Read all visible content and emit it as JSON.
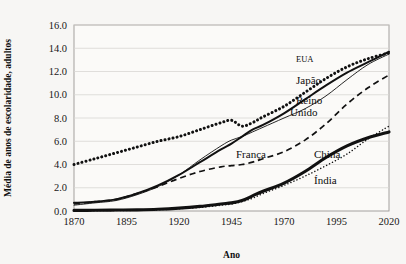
{
  "axes": {
    "y_title": "Média de anos de escolaridade, adultos",
    "x_title": "Ano",
    "y_ticks": [
      "0.0",
      "2.0",
      "4.0",
      "6.0",
      "8.0",
      "10.0",
      "12.0",
      "14.0",
      "16.0"
    ],
    "x_ticks": [
      "1870",
      "1895",
      "1920",
      "1945",
      "1970",
      "1995",
      "2020"
    ]
  },
  "labels": {
    "eua": "EUA",
    "japao": "Japão",
    "reino": "Reino",
    "unido": "Unido",
    "franca": "França",
    "china": "China",
    "india": "Índia"
  },
  "colors": {
    "ink": "#111111",
    "background": "#f7f6f4",
    "plot_background": "#fbfaf8",
    "grid": "#d9d7d3"
  },
  "chart_data": {
    "type": "line",
    "title": "",
    "xlabel": "Ano",
    "ylabel": "Média de anos de escolaridade, adultos",
    "xlim": [
      1870,
      2020
    ],
    "ylim": [
      0.0,
      16.0
    ],
    "grid": true,
    "legend": "inline-annotations",
    "x": [
      1870,
      1880,
      1890,
      1900,
      1910,
      1920,
      1930,
      1940,
      1945,
      1950,
      1955,
      1960,
      1970,
      1980,
      1990,
      2000,
      2010,
      2020
    ],
    "series": [
      {
        "name": "EUA",
        "style": "dotted-thick",
        "values": [
          4.0,
          4.5,
          5.0,
          5.5,
          6.0,
          6.4,
          7.0,
          7.6,
          7.8,
          7.3,
          7.6,
          8.1,
          9.0,
          10.2,
          11.4,
          12.4,
          13.1,
          13.6
        ]
      },
      {
        "name": "Japão",
        "style": "solid-thick",
        "values": [
          0.7,
          0.8,
          1.0,
          1.5,
          2.2,
          3.1,
          4.2,
          5.3,
          5.8,
          6.4,
          7.0,
          7.4,
          8.4,
          9.6,
          10.8,
          11.9,
          12.8,
          13.7
        ]
      },
      {
        "name": "Reino Unido",
        "style": "solid-thin",
        "values": [
          0.5,
          0.7,
          0.9,
          1.4,
          2.1,
          3.1,
          4.4,
          5.6,
          6.1,
          6.4,
          6.8,
          7.2,
          8.0,
          8.8,
          9.9,
          11.3,
          12.6,
          13.5
        ]
      },
      {
        "name": "França",
        "style": "dashed",
        "values": [
          0.6,
          0.8,
          1.0,
          1.5,
          2.1,
          2.8,
          3.4,
          3.8,
          3.9,
          4.0,
          4.2,
          4.5,
          5.1,
          6.1,
          7.5,
          9.2,
          10.6,
          11.7
        ]
      },
      {
        "name": "China",
        "style": "solid-very-thick",
        "values": [
          0.05,
          0.06,
          0.08,
          0.1,
          0.15,
          0.25,
          0.4,
          0.6,
          0.7,
          0.9,
          1.3,
          1.7,
          2.4,
          3.4,
          4.6,
          5.6,
          6.3,
          6.8
        ]
      },
      {
        "name": "Índia",
        "style": "dotted-fine",
        "values": [
          0.02,
          0.03,
          0.04,
          0.06,
          0.1,
          0.2,
          0.3,
          0.5,
          0.6,
          0.8,
          1.1,
          1.5,
          2.2,
          3.0,
          3.9,
          4.9,
          6.2,
          7.3
        ]
      }
    ]
  }
}
